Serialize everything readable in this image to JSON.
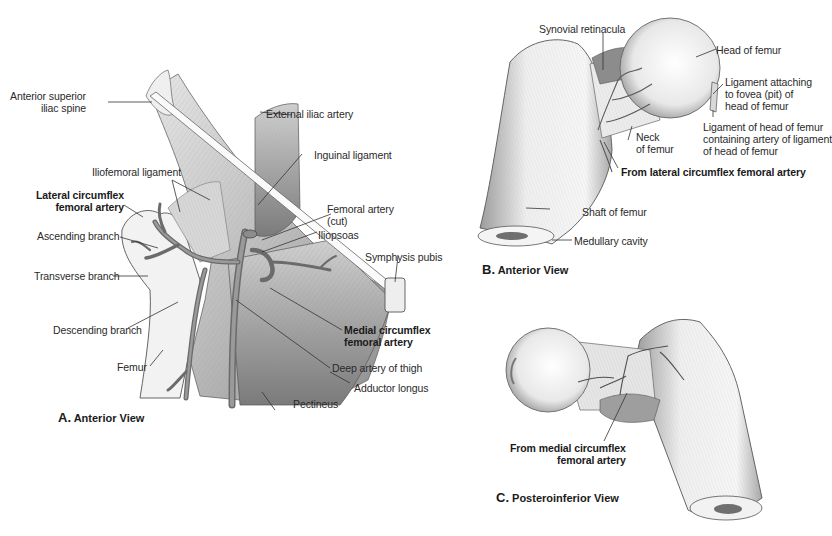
{
  "figure": {
    "panels": [
      {
        "id": "A",
        "caption_letter": "A.",
        "caption_text": "Anterior View",
        "labels": {
          "anterior_superior_iliac_spine": [
            "Anterior superior",
            "iliac spine"
          ],
          "external_iliac_artery": "External iliac artery",
          "inguinal_ligament": "Inguinal ligament",
          "iliofemoral_ligament": "Iliofemoral ligament",
          "lateral_circumflex_femoral_artery": [
            "Lateral circumflex",
            "femoral artery"
          ],
          "femoral_artery_cut": [
            "Femoral artery",
            "(cut)"
          ],
          "iliopsoas": "Iliopsoas",
          "ascending_branch": "Ascending branch",
          "symphysis_pubis": "Symphysis pubis",
          "transverse_branch": "Transverse branch",
          "descending_branch": "Descending branch",
          "medial_circumflex_femoral_artery": [
            "Medial circumflex",
            "femoral artery"
          ],
          "femur": "Femur",
          "deep_artery_of_thigh": "Deep artery of thigh",
          "adductor_longus": "Adductor longus",
          "pectineus": "Pectineus"
        }
      },
      {
        "id": "B",
        "caption_letter": "B.",
        "caption_text": "Anterior View",
        "labels": {
          "synovial_retinacula": "Synovial retinacula",
          "head_of_femur": "Head of femur",
          "ligament_attaching_fovea": [
            "Ligament attaching",
            "to fovea (pit)  of",
            "head of femur"
          ],
          "ligament_of_head": [
            "Ligament of head of femur",
            "containing artery of ligament",
            "of head of femur"
          ],
          "neck_of_femur": [
            "Neck",
            "of femur"
          ],
          "from_lateral_circumflex": "From lateral circumflex femoral artery",
          "shaft_of_femur": "Shaft of femur",
          "medullary_cavity": "Medullary cavity"
        }
      },
      {
        "id": "C",
        "caption_letter": "C.",
        "caption_text": "Posteroinferior View",
        "labels": {
          "from_medial_circumflex": [
            "From medial circumflex",
            "femoral artery"
          ]
        }
      }
    ]
  }
}
